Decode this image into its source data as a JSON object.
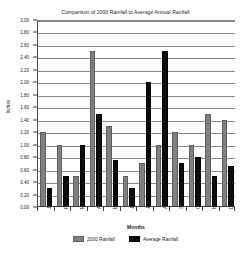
{
  "chart_data": {
    "type": "bar",
    "title": "Comparison of 2000 Rainfall to Average Annual Rainfall",
    "xlabel": "Months",
    "ylabel": "Inches",
    "ylim": [
      0,
      3.0
    ],
    "ytick_step": 0.2,
    "grid": true,
    "legend_position": "bottom",
    "categories": [
      "Jan",
      "Feb",
      "Mar",
      "Apr",
      "May",
      "Jun",
      "Jul",
      "Aug",
      "Sep",
      "Oct",
      "Nov",
      "Dec"
    ],
    "ytick_labels": [
      "3.00",
      "2.80",
      "2.60",
      "2.40",
      "2.20",
      "2.00",
      "1.80",
      "1.60",
      "1.40",
      "1.20",
      "1.00",
      "0.80",
      "0.60",
      "0.40",
      "0.20",
      "0.00"
    ],
    "series": [
      {
        "name": "2000 Rainfall",
        "color": "#808080",
        "values": [
          1.2,
          1.0,
          0.5,
          2.5,
          1.3,
          0.5,
          0.7,
          1.0,
          1.2,
          1.0,
          1.5,
          1.4
        ]
      },
      {
        "name": "Average Rainfall",
        "color": "#0d0d0d",
        "values": [
          0.3,
          0.5,
          1.0,
          1.5,
          0.75,
          0.3,
          2.0,
          2.5,
          0.7,
          0.8,
          0.5,
          0.65
        ]
      }
    ]
  }
}
